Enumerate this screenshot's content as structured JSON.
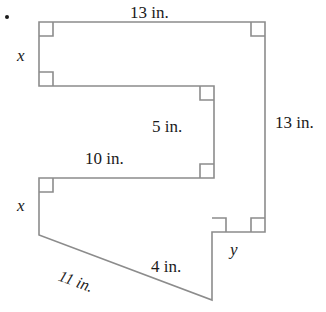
{
  "figure": {
    "stroke_color": "#8c8c8c",
    "stroke_width": 1.6,
    "text_color": "#1a1a1a",
    "bullet": {
      "name": "problem-bullet",
      "x": 5,
      "y": 15
    },
    "vertices": [
      {
        "x": 39,
        "y": 22
      },
      {
        "x": 265,
        "y": 22
      },
      {
        "x": 265,
        "y": 232
      },
      {
        "x": 212,
        "y": 232
      },
      {
        "x": 212,
        "y": 300
      },
      {
        "x": 39,
        "y": 235
      },
      {
        "x": 39,
        "y": 178
      },
      {
        "x": 214,
        "y": 178
      },
      {
        "x": 214,
        "y": 86
      },
      {
        "x": 39,
        "y": 86
      }
    ],
    "right_angle_markers": [
      {
        "name": "right-angle-top-left",
        "x": 39,
        "y": 22,
        "dx": 1,
        "dy": 1
      },
      {
        "name": "right-angle-top-right",
        "x": 265,
        "y": 22,
        "dx": -1,
        "dy": 1
      },
      {
        "name": "right-angle-mid-left-lower",
        "x": 39,
        "y": 86,
        "dx": 1,
        "dy": -1
      },
      {
        "name": "right-angle-notch-upper",
        "x": 214,
        "y": 86,
        "dx": -1,
        "dy": 1
      },
      {
        "name": "right-angle-notch-lower",
        "x": 214,
        "y": 178,
        "dx": -1,
        "dy": -1
      },
      {
        "name": "right-angle-lower-left",
        "x": 39,
        "y": 178,
        "dx": 1,
        "dy": 1
      },
      {
        "name": "right-angle-step-outer",
        "x": 265,
        "y": 232,
        "dx": -1,
        "dy": -1
      },
      {
        "name": "right-angle-step-inner",
        "x": 212,
        "y": 232,
        "dx": 1,
        "dy": -1
      }
    ],
    "labels": [
      {
        "name": "label-top-13in",
        "text": "13 in.",
        "x": 130,
        "y": 4,
        "style": "len"
      },
      {
        "name": "label-left-x-top",
        "text": "x",
        "x": 17,
        "y": 47,
        "style": "var"
      },
      {
        "name": "label-5in",
        "text": "5 in.",
        "x": 152,
        "y": 118,
        "style": "len"
      },
      {
        "name": "label-right-13in",
        "text": "13 in.",
        "x": 275,
        "y": 114,
        "style": "len"
      },
      {
        "name": "label-10in",
        "text": "10 in.",
        "x": 85,
        "y": 150,
        "style": "len"
      },
      {
        "name": "label-left-x-bot",
        "text": "x",
        "x": 17,
        "y": 197,
        "style": "var"
      },
      {
        "name": "label-y",
        "text": "y",
        "x": 230,
        "y": 241,
        "style": "var"
      },
      {
        "name": "label-4in",
        "text": "4 in.",
        "x": 151,
        "y": 258,
        "style": "len"
      }
    ],
    "diagonal_label": {
      "name": "label-11in-diagonal",
      "text": "11 in.",
      "x": 62,
      "y": 268,
      "rotation_deg": 20
    }
  }
}
